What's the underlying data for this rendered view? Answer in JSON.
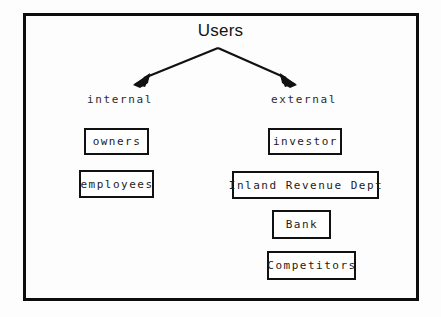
{
  "diagram": {
    "title": "Users",
    "frame": {
      "border_color": "#0d0d0d",
      "background_color": "#fdfdfd"
    },
    "branches": [
      {
        "id": "internal",
        "label": "internal",
        "nodes": [
          {
            "id": "owners",
            "label": "owners"
          },
          {
            "id": "employees",
            "label": "employees"
          }
        ]
      },
      {
        "id": "external",
        "label": "external",
        "nodes": [
          {
            "id": "investor",
            "label": "investor"
          },
          {
            "id": "inland-revenue-dept",
            "label": "Inland Revenue Dept"
          },
          {
            "id": "bank",
            "label": "Bank"
          },
          {
            "id": "competitors",
            "label": "Competitors"
          }
        ]
      }
    ],
    "connectors": [
      {
        "id": "arrow-to-internal",
        "icon": "arrow-down-left-icon",
        "from": "Users",
        "to": "internal"
      },
      {
        "id": "arrow-to-external",
        "icon": "arrow-down-right-icon",
        "from": "Users",
        "to": "external"
      }
    ]
  }
}
